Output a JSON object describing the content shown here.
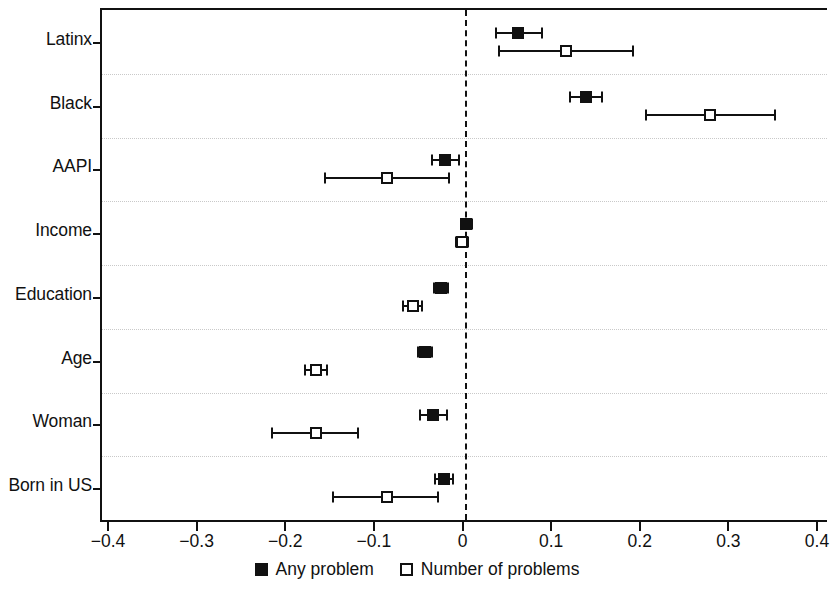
{
  "chart_data": {
    "type": "scatter",
    "subtype": "coefficient-forest-plot",
    "title": "",
    "xlabel": "",
    "ylabel": "",
    "xlim": [
      -0.4,
      0.4
    ],
    "xticks": [
      -0.4,
      -0.3,
      -0.2,
      -0.1,
      0,
      0.1,
      0.2,
      0.3,
      0.4
    ],
    "xticklabels": [
      "−0.4",
      "−0.3",
      "−0.2",
      "−0.1",
      "0",
      "0.1",
      "0.2",
      "0.3",
      "0.4"
    ],
    "categories": [
      "Latinx",
      "Black",
      "AAPI",
      "Income",
      "Education",
      "Age",
      "Woman",
      "Born in US"
    ],
    "grid": "horizontal-dotted-between-categories",
    "reference_line": 0,
    "reference_line_style": "dashed",
    "legend_position": "bottom-center",
    "series": [
      {
        "name": "Any problem",
        "marker": "filled-square",
        "color": "#111111",
        "estimates": [
          0.06,
          0.137,
          -0.022,
          0.002,
          -0.026,
          -0.045,
          -0.035,
          -0.023
        ],
        "ci_low": [
          0.035,
          0.119,
          -0.037,
          -0.004,
          -0.034,
          -0.053,
          -0.05,
          -0.033
        ],
        "ci_high": [
          0.087,
          0.155,
          -0.006,
          0.008,
          -0.019,
          -0.037,
          -0.02,
          -0.013
        ]
      },
      {
        "name": "Number of problems",
        "marker": "hollow-square",
        "color": "#111111",
        "estimates": [
          0.114,
          0.277,
          -0.088,
          -0.003,
          -0.058,
          -0.168,
          -0.168,
          -0.088
        ],
        "ci_low": [
          0.039,
          0.205,
          -0.157,
          -0.01,
          -0.069,
          -0.18,
          -0.217,
          -0.148
        ],
        "ci_high": [
          0.19,
          0.35,
          -0.018,
          0.004,
          -0.048,
          -0.155,
          -0.12,
          -0.03
        ]
      }
    ],
    "legend": [
      {
        "label": "Any problem",
        "marker": "filled-square"
      },
      {
        "label": "Number of problems",
        "marker": "hollow-square"
      }
    ]
  }
}
